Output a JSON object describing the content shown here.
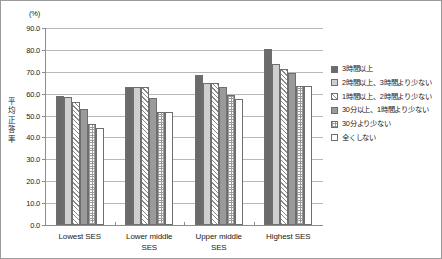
{
  "chart_data": {
    "type": "bar",
    "title": "",
    "subtitle": "",
    "unit_label": "(%)",
    "ylabel": "平均正答率",
    "ylabel_chars": [
      "平",
      "均",
      "正",
      "答",
      "率"
    ],
    "xlabel": "",
    "categories": [
      "Lowest SES",
      "Lower middle SES",
      "Upper middle SES",
      "Highest SES"
    ],
    "category_lines": [
      [
        "Lowest SES"
      ],
      [
        "Lower middle",
        "SES"
      ],
      [
        "Upper middle",
        "SES"
      ],
      [
        "Highest SES"
      ]
    ],
    "ylim": [
      0.0,
      90.0
    ],
    "yticks": [
      0.0,
      10.0,
      20.0,
      30.0,
      40.0,
      50.0,
      60.0,
      70.0,
      80.0,
      90.0
    ],
    "ytick_labels": [
      "0.0",
      "10.0",
      "20.0",
      "30.0",
      "40.0",
      "50.0",
      "60.0",
      "70.0",
      "80.0",
      "90.0"
    ],
    "grid": true,
    "legend_position": "right",
    "series": [
      {
        "name": "3時間以上",
        "pattern": "solid-dark",
        "color": "#6b6b6b",
        "values": [
          59.0,
          63.0,
          68.5,
          80.5
        ]
      },
      {
        "name": "2時間以上、3時間より少ない",
        "pattern": "solid-light",
        "color": "#cfcfcf",
        "values": [
          58.5,
          63.0,
          65.0,
          73.5
        ]
      },
      {
        "name": "1時間以上、2時間より少ない",
        "pattern": "diagonal-hatch",
        "color": "#ffffff",
        "values": [
          56.0,
          63.0,
          65.0,
          71.5
        ]
      },
      {
        "name": "30分以上、1時間より少ない",
        "pattern": "solid-mid",
        "color": "#9a9a9a",
        "values": [
          53.0,
          58.0,
          63.0,
          69.5
        ]
      },
      {
        "name": "30分より少ない",
        "pattern": "checker",
        "color": "#ffffff",
        "values": [
          46.0,
          51.5,
          59.5,
          63.5
        ]
      },
      {
        "name": "全くしない",
        "pattern": "none",
        "color": "#ffffff",
        "values": [
          44.5,
          51.5,
          57.5,
          63.5
        ]
      }
    ]
  }
}
